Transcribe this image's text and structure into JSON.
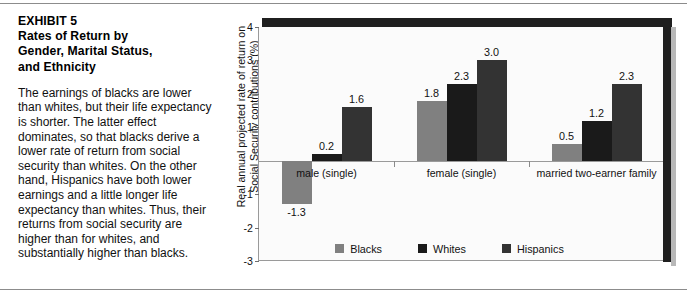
{
  "exhibit": {
    "title_lines": [
      "EXHIBIT 5",
      "Rates of Return by",
      "Gender, Marital Status,",
      "and Ethnicity"
    ],
    "body": "The earnings of blacks are lower than whites, but their life expectancy is shorter. The latter effect dominates, so that blacks derive a lower rate of return from social security than whites. On the other hand, Hispanics have both lower earnings and a little longer life expectancy than whites. Thus, their returns from social security are higher than for whites, and substantially higher than blacks."
  },
  "chart_data": {
    "type": "bar",
    "title": "",
    "xlabel": "",
    "ylabel": "Real annual projected rate of return on Social Security contributions (%)",
    "ylim": [
      -3,
      4
    ],
    "yticks": [
      4,
      3,
      2,
      1,
      -1,
      -2,
      -3
    ],
    "ytick_labels": [
      "4",
      "3",
      "2",
      "1",
      "-1",
      "-2",
      "-3"
    ],
    "grid": false,
    "legend_position": "bottom",
    "categories": [
      "male (single)",
      "female (single)",
      "married two-earner family"
    ],
    "series": [
      {
        "name": "Blacks",
        "color": "#808080",
        "values": [
          -1.3,
          1.8,
          0.5
        ],
        "labels": [
          "-1.3",
          "1.8",
          "0.5"
        ]
      },
      {
        "name": "Whites",
        "color": "#1a1a1a",
        "values": [
          0.2,
          2.3,
          1.2
        ],
        "labels": [
          "0.2",
          "2.3",
          "1.2"
        ]
      },
      {
        "name": "Hispanics",
        "color": "#333333",
        "values": [
          1.6,
          3.0,
          2.3
        ],
        "labels": [
          "1.6",
          "3.0",
          "2.3"
        ]
      }
    ]
  },
  "colors": {
    "blacks": "#808080",
    "whites": "#1a1a1a",
    "hispanics": "#333333",
    "frame": "#1f1f1f",
    "axis": "#9a9a9a"
  }
}
